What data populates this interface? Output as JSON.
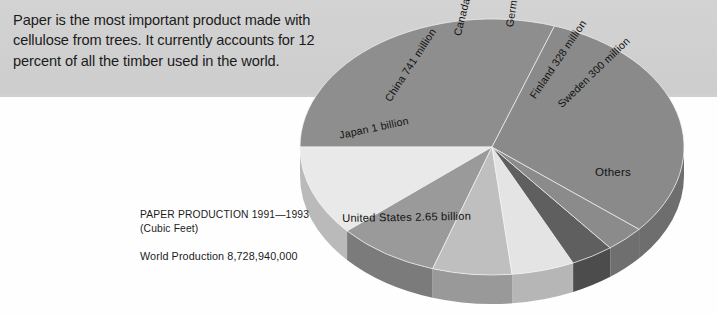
{
  "intro": {
    "text": "Paper is the most important product made with cellulose from trees. It currently accounts for 12 percent of all the timber used in the world."
  },
  "caption": {
    "title": "PAPER PRODUCTION 1991—1993",
    "units": "(Cubic Feet)",
    "world_total": "World Production 8,728,940,000"
  },
  "colors": {
    "banner": "#cfcfcf",
    "page": "#fefefe",
    "text": "#1b1b1b",
    "slice_us": "#8e8e8e",
    "slice_japan": "#e9e9e9",
    "slice_china": "#9a9a9a",
    "slice_canada": "#bfbfbf",
    "slice_germany": "#e4e4e4",
    "slice_finland": "#5f5f5f",
    "slice_sweden": "#8b8b8b",
    "slice_others": "#8a8a8a"
  },
  "chart_data": {
    "type": "pie",
    "title": "PAPER PRODUCTION 1991—1993",
    "subtitle": "(Cubic Feet)",
    "annotations": [
      "World Production 8,728,940,000",
      "Paper is the most important product made with cellulose from trees. It currently accounts for 12 percent of all the timber used in the world."
    ],
    "units": "cubic feet",
    "total": 8728940000,
    "legend_position": "none",
    "grid": false,
    "labels_on_slices": true,
    "categories": [
      "United States",
      "Japan",
      "China",
      "Canada",
      "Germany",
      "Finland",
      "Sweden",
      "Others"
    ],
    "values": [
      2650000000,
      1000000000,
      741000000,
      596000000,
      459000000,
      328000000,
      300000000,
      2654940000
    ],
    "slices": [
      {
        "name": "United States",
        "label": "United States 2.65 billion",
        "value": 2650000000,
        "value_text": "2.65 billion",
        "percent": 30.4,
        "color": "#8e8e8e",
        "start_angle": 180,
        "end_angle": 289,
        "label_x": 342,
        "label_y": 212,
        "rotate": -1
      },
      {
        "name": "Japan",
        "label": "Japan 1 billion",
        "value": 1000000000,
        "value_text": "1 billion",
        "percent": 11.5,
        "color": "#e9e9e9",
        "start_angle": 139,
        "end_angle": 180,
        "label_x": 338,
        "label_y": 129,
        "rotate": -12
      },
      {
        "name": "China",
        "label": "China 741 million",
        "value": 741000000,
        "value_text": "741 million",
        "percent": 8.5,
        "color": "#9a9a9a",
        "start_angle": 108,
        "end_angle": 139,
        "label_x": 382,
        "label_y": 97,
        "rotate": -57
      },
      {
        "name": "Canada",
        "label": "Canada 596 million",
        "value": 596000000,
        "value_text": "596 million",
        "percent": 6.8,
        "color": "#bfbfbf",
        "start_angle": 84,
        "end_angle": 108,
        "label_x": 451,
        "label_y": 34,
        "rotate": -76
      },
      {
        "name": "Germany",
        "label": "Germany 459 million",
        "value": 459000000,
        "value_text": "459 million",
        "percent": 5.3,
        "color": "#e4e4e4",
        "start_angle": 65,
        "end_angle": 84,
        "label_x": 503,
        "label_y": 26,
        "rotate": -81
      },
      {
        "name": "Finland",
        "label": "Finland 328 million",
        "value": 328000000,
        "value_text": "328 million",
        "percent": 3.8,
        "color": "#5f5f5f",
        "start_angle": 52,
        "end_angle": 65,
        "label_x": 527,
        "label_y": 94,
        "rotate": -56
      },
      {
        "name": "Sweden",
        "label": "Sweden 300 million",
        "value": 300000000,
        "value_text": "300 million",
        "percent": 3.4,
        "color": "#8b8b8b",
        "start_angle": 40,
        "end_angle": 52,
        "label_x": 555,
        "label_y": 101,
        "rotate": -44
      },
      {
        "name": "Others",
        "label": "Others",
        "value": 2654940000,
        "value_text": "",
        "percent": 30.4,
        "color": "#8a8a8a",
        "start_angle": 289,
        "end_angle": 400,
        "label_x": 595,
        "label_y": 165,
        "rotate": 0
      }
    ],
    "geometry": {
      "cx": 492,
      "cy": 147,
      "rx": 192,
      "ry": 128,
      "depth": 29
    }
  }
}
